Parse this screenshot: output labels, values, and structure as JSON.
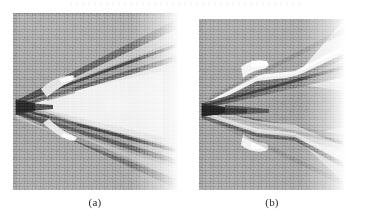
{
  "figure": {
    "kind": "schlieren-photograph-pair",
    "page_background": "#ffffff",
    "panels": [
      {
        "id": "a",
        "caption": "(a)",
        "subject": "supersonic wedge with attached oblique shock waves",
        "bounds": {
          "x": 13,
          "y": 13,
          "width": 165,
          "height": 177
        },
        "apex": {
          "x": 16,
          "y": 103
        },
        "background_gray": "#9c9c9c",
        "shock_gray": "#4a4a4a",
        "expansion_light": "#f2f2f2",
        "features": [
          "sharp leading-edge apex at mid-height on the left",
          "upper oblique shock rising to the upper-right",
          "lower oblique shock descending to the lower-right",
          "bright low-density expansion wedge downstream of the body",
          "secondary weaker shock line above and below the primary pair",
          "small bright separation bubble on each surface near the shoulder"
        ]
      },
      {
        "id": "b",
        "caption": "(b)",
        "subject": "supersonic wedge with kinked / bent shock structure",
        "bounds": {
          "x": 199,
          "y": 19,
          "width": 146,
          "height": 171
        },
        "apex": {
          "x": 202,
          "y": 108
        },
        "background_gray": "#9a9a9a",
        "shock_gray": "#3f3f3f",
        "expansion_light": "#f4f4f4",
        "features": [
          "sharp leading-edge apex at mid-height on the left",
          "dark wedge-shaped body wake opening to the right",
          "kinked upper shock with a bright highlight line along the bend",
          "kinked lower shock mirrored about the centerline",
          "bright expansion region fanning out to the upper-right corner",
          "plate edge fading into the paper at the far right"
        ]
      }
    ],
    "captions": [
      {
        "text": "(a)",
        "x": 95,
        "y": 198
      },
      {
        "text": "(b)",
        "x": 272,
        "y": 198
      }
    ]
  }
}
